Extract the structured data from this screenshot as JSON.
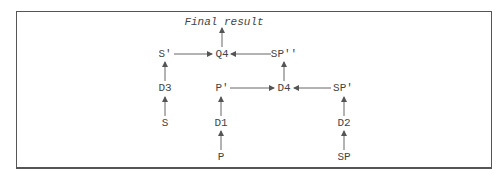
{
  "diagram": {
    "title_node": "Final result",
    "nodes": {
      "final": "Final result",
      "s_prime": "S'",
      "q4": "Q4",
      "sp_dprime": "SP''",
      "d3": "D3",
      "p_prime": "P'",
      "d4": "D4",
      "sp_prime": "SP'",
      "s": "S",
      "d1": "D1",
      "d2": "D2",
      "p": "P",
      "sp": "SP"
    },
    "edges": [
      {
        "from": "S",
        "to": "D3"
      },
      {
        "from": "D3",
        "to": "S'"
      },
      {
        "from": "S'",
        "to": "Q4"
      },
      {
        "from": "SP''",
        "to": "Q4"
      },
      {
        "from": "Q4",
        "to": "Final result"
      },
      {
        "from": "P",
        "to": "D1"
      },
      {
        "from": "D1",
        "to": "P'"
      },
      {
        "from": "P'",
        "to": "D4"
      },
      {
        "from": "SP'",
        "to": "D4"
      },
      {
        "from": "D4",
        "to": "SP''"
      },
      {
        "from": "SP",
        "to": "D2"
      },
      {
        "from": "D2",
        "to": "SP'"
      }
    ],
    "colors": {
      "line": "#555555",
      "text": "#444444",
      "frame": "#555555"
    }
  }
}
